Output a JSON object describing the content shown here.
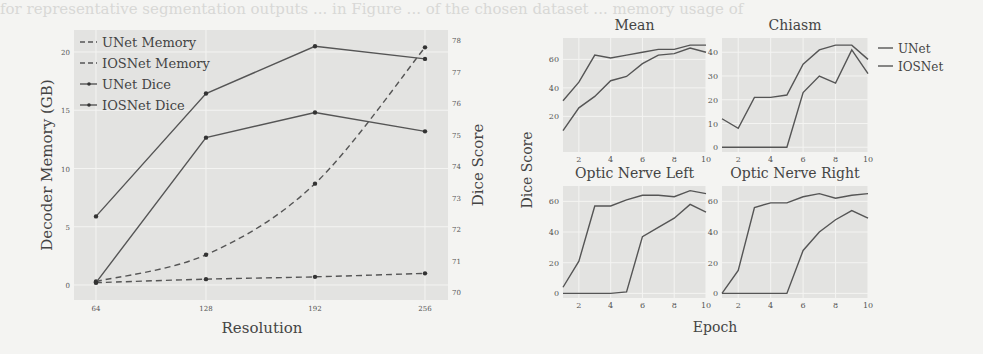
{
  "background_text": "for representative segmentation outputs ... in Figure ... of the chosen dataset ... memory usage of",
  "chart_data": [
    {
      "type": "line",
      "title": "",
      "xlabel": "Resolution",
      "ylabel": "Decoder Memory (GB)",
      "y2label": "Dice Score",
      "categories": [
        64,
        128,
        192,
        256
      ],
      "x_tick_labels": [
        "64",
        "128",
        "192",
        "256"
      ],
      "ylim": [
        -1,
        21.5
      ],
      "y_ticks": [
        0,
        5,
        10,
        15,
        20
      ],
      "y2lim": [
        69.8,
        78.2
      ],
      "y2_ticks": [
        70,
        71,
        72,
        73,
        74,
        75,
        76,
        77,
        78
      ],
      "grid": true,
      "legend_position": "upper left",
      "series": [
        {
          "name": "UNet Memory",
          "axis": "left",
          "style": "dashed",
          "values": [
            0.3,
            2.6,
            8.7,
            20.4
          ]
        },
        {
          "name": "IOSNet Memory",
          "axis": "left",
          "style": "dashed",
          "values": [
            0.2,
            0.5,
            0.7,
            1.0
          ]
        },
        {
          "name": "UNet Dice",
          "axis": "right",
          "style": "solid-marker",
          "values": [
            70.3,
            74.9,
            75.7,
            75.1
          ]
        },
        {
          "name": "IOSNet Dice",
          "axis": "right",
          "style": "solid-marker",
          "values": [
            72.4,
            76.3,
            77.8,
            77.4
          ]
        }
      ]
    },
    {
      "type": "line",
      "title": "Mean",
      "xlabel": "Epoch",
      "ylabel": "Dice Score",
      "x": [
        1,
        2,
        3,
        4,
        5,
        6,
        7,
        8,
        9,
        10
      ],
      "x_ticks": [
        2,
        4,
        6,
        8,
        10
      ],
      "ylim": [
        -5,
        75
      ],
      "y_ticks": [
        20,
        40,
        60
      ],
      "series": [
        {
          "name": "UNet",
          "values": [
            10,
            26,
            34,
            45,
            48,
            57,
            63,
            64,
            68,
            65
          ]
        },
        {
          "name": "IOSNet",
          "values": [
            31,
            44,
            63,
            61,
            63,
            65,
            67,
            67,
            70,
            70
          ]
        }
      ]
    },
    {
      "type": "line",
      "title": "Chiasm",
      "xlabel": "Epoch",
      "ylabel": "Dice Score",
      "x": [
        1,
        2,
        3,
        4,
        5,
        6,
        7,
        8,
        9,
        10
      ],
      "x_ticks": [
        2,
        4,
        6,
        8,
        10
      ],
      "ylim": [
        -2,
        46
      ],
      "y_ticks": [
        0,
        10,
        20,
        30,
        40
      ],
      "series": [
        {
          "name": "UNet",
          "values": [
            0,
            0,
            0,
            0,
            0,
            23,
            30,
            27,
            41,
            31
          ]
        },
        {
          "name": "IOSNet",
          "values": [
            12,
            8,
            21,
            21,
            22,
            35,
            41,
            43,
            43,
            37
          ]
        }
      ]
    },
    {
      "type": "line",
      "title": "Optic Nerve Left",
      "xlabel": "Epoch",
      "ylabel": "Dice Score",
      "x": [
        1,
        2,
        3,
        4,
        5,
        6,
        7,
        8,
        9,
        10
      ],
      "x_ticks": [
        2,
        4,
        6,
        8,
        10
      ],
      "ylim": [
        -3,
        70
      ],
      "y_ticks": [
        0,
        20,
        40,
        60
      ],
      "series": [
        {
          "name": "UNet",
          "values": [
            0,
            0,
            0,
            0,
            1,
            37,
            43,
            49,
            58,
            53
          ]
        },
        {
          "name": "IOSNet",
          "values": [
            4,
            21,
            57,
            57,
            61,
            64,
            64,
            63,
            67,
            65
          ]
        }
      ]
    },
    {
      "type": "line",
      "title": "Optic Nerve Right",
      "xlabel": "Epoch",
      "ylabel": "Dice Score",
      "x": [
        1,
        2,
        3,
        4,
        5,
        6,
        7,
        8,
        9,
        10
      ],
      "x_ticks": [
        2,
        4,
        6,
        8,
        10
      ],
      "ylim": [
        -3,
        70
      ],
      "y_ticks": [
        0,
        20,
        40,
        60
      ],
      "series": [
        {
          "name": "UNet",
          "values": [
            0,
            0,
            0,
            0,
            0,
            28,
            40,
            48,
            54,
            49
          ]
        },
        {
          "name": "IOSNet",
          "values": [
            0,
            15,
            56,
            59,
            59,
            63,
            65,
            62,
            64,
            65
          ]
        }
      ]
    }
  ],
  "right_legend": [
    "UNet",
    "IOSNet"
  ],
  "shared_labels": {
    "ylabel": "Dice Score",
    "xlabel": "Epoch"
  }
}
